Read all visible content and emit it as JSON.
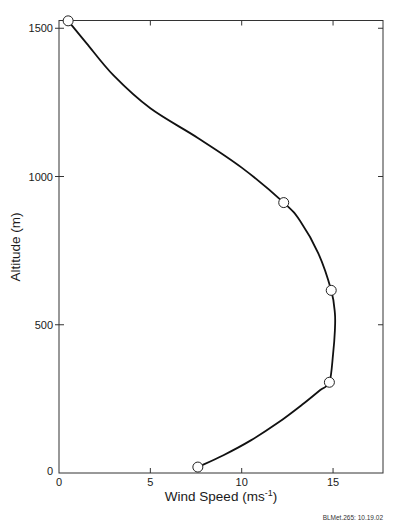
{
  "chart_data": {
    "type": "line",
    "title": "",
    "xlabel": "Wind Speed (ms-1)",
    "xlabel_main": "Wind Speed (ms",
    "xlabel_sup": "-1",
    "xlabel_close": ")",
    "ylabel": "Altitude (m)",
    "xlim": [
      0,
      17.7
    ],
    "ylim": [
      0,
      1530
    ],
    "xticks": [
      0,
      5,
      10,
      15
    ],
    "xtick_labels": [
      "0",
      "5",
      "10",
      "15"
    ],
    "yticks": [
      0,
      500,
      1000,
      1500
    ],
    "ytick_labels": [
      "0",
      "500",
      "1000",
      "1500"
    ],
    "grid": false,
    "legend": null,
    "series": [
      {
        "name": "Wind speed profile (observed points)",
        "marker": "open-circle",
        "points": [
          {
            "x": 7.6,
            "y": 20
          },
          {
            "x": 14.8,
            "y": 306
          },
          {
            "x": 14.9,
            "y": 616
          },
          {
            "x": 12.3,
            "y": 912
          },
          {
            "x": 0.5,
            "y": 1525
          }
        ]
      },
      {
        "name": "Fitted smooth curve",
        "marker": "none",
        "points": [
          {
            "x": 7.6,
            "y": 20
          },
          {
            "x": 9.0,
            "y": 60
          },
          {
            "x": 10.5,
            "y": 110
          },
          {
            "x": 12.0,
            "y": 170
          },
          {
            "x": 13.3,
            "y": 230
          },
          {
            "x": 14.3,
            "y": 280
          },
          {
            "x": 14.8,
            "y": 306
          },
          {
            "x": 15.0,
            "y": 400
          },
          {
            "x": 15.1,
            "y": 480
          },
          {
            "x": 15.1,
            "y": 540
          },
          {
            "x": 14.9,
            "y": 616
          },
          {
            "x": 14.2,
            "y": 740
          },
          {
            "x": 13.2,
            "y": 850
          },
          {
            "x": 12.3,
            "y": 912
          },
          {
            "x": 10.0,
            "y": 1030
          },
          {
            "x": 7.6,
            "y": 1130
          },
          {
            "x": 5.0,
            "y": 1230
          },
          {
            "x": 3.0,
            "y": 1340
          },
          {
            "x": 1.5,
            "y": 1450
          },
          {
            "x": 0.5,
            "y": 1525
          }
        ]
      }
    ],
    "annotations": [
      "BLMet.265: 10.19.02"
    ]
  },
  "footnote": "BLMet.265: 10.19.02",
  "colors": {
    "line": "#111111",
    "axis": "#333333",
    "marker_fill": "#ffffff",
    "background": "#ffffff"
  }
}
